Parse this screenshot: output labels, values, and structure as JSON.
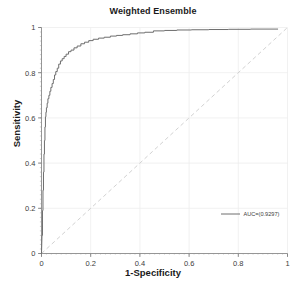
{
  "chart_data": {
    "type": "line",
    "title": "Weighted Ensemble",
    "xlabel": "1-Specificity",
    "ylabel": "Sensitivity",
    "xlim": [
      0,
      1
    ],
    "ylim": [
      0,
      1
    ],
    "grid": true,
    "legend_position": "lower-right",
    "legend": [
      {
        "name": "AUC=(0.9297)",
        "color": "#6e6e6e"
      }
    ],
    "annotations": [
      {
        "name": "chance-diagonal",
        "style": "dashed",
        "color": "#d2d2d2",
        "from": [
          0,
          0
        ],
        "to": [
          1,
          1
        ]
      }
    ],
    "xticks": [
      "0",
      "0.2",
      "0.4",
      "0.6",
      "0.8",
      "1"
    ],
    "xtick_values": [
      0,
      0.2,
      0.4,
      0.6,
      0.8,
      1
    ],
    "yticks": [
      "0",
      "0.2",
      "0.4",
      "0.6",
      "0.8",
      "1"
    ],
    "ytick_values": [
      0,
      0.2,
      0.4,
      0.6,
      0.8,
      1
    ],
    "auc": 0.9297,
    "series": [
      {
        "name": "AUC=(0.9297)",
        "color": "#6e6e6e",
        "x": [
          0,
          0.002,
          0.004,
          0.004,
          0.006,
          0.006,
          0.008,
          0.008,
          0.01,
          0.01,
          0.012,
          0.012,
          0.014,
          0.014,
          0.016,
          0.016,
          0.018,
          0.018,
          0.02,
          0.02,
          0.023,
          0.023,
          0.026,
          0.026,
          0.03,
          0.03,
          0.034,
          0.034,
          0.038,
          0.038,
          0.043,
          0.043,
          0.048,
          0.048,
          0.053,
          0.053,
          0.058,
          0.058,
          0.064,
          0.064,
          0.07,
          0.07,
          0.077,
          0.077,
          0.084,
          0.084,
          0.092,
          0.092,
          0.1,
          0.1,
          0.11,
          0.11,
          0.12,
          0.12,
          0.132,
          0.132,
          0.145,
          0.145,
          0.16,
          0.16,
          0.175,
          0.175,
          0.192,
          0.192,
          0.21,
          0.21,
          0.232,
          0.232,
          0.255,
          0.255,
          0.28,
          0.28,
          0.305,
          0.305,
          0.33,
          0.33,
          0.36,
          0.36,
          0.39,
          0.39,
          0.42,
          0.42,
          0.455,
          0.455,
          0.5,
          0.5,
          0.55,
          0.55,
          0.61,
          0.61,
          0.68,
          0.68,
          0.76,
          0.76,
          0.85,
          0.85,
          0.96
        ],
        "y": [
          0,
          0.08,
          0.08,
          0.19,
          0.19,
          0.28,
          0.28,
          0.36,
          0.36,
          0.44,
          0.44,
          0.5,
          0.5,
          0.56,
          0.56,
          0.605,
          0.605,
          0.625,
          0.625,
          0.645,
          0.645,
          0.665,
          0.665,
          0.685,
          0.685,
          0.7,
          0.7,
          0.718,
          0.718,
          0.735,
          0.735,
          0.752,
          0.752,
          0.77,
          0.77,
          0.79,
          0.79,
          0.805,
          0.805,
          0.82,
          0.82,
          0.838,
          0.838,
          0.852,
          0.852,
          0.862,
          0.862,
          0.872,
          0.872,
          0.882,
          0.882,
          0.893,
          0.893,
          0.9,
          0.9,
          0.91,
          0.91,
          0.918,
          0.918,
          0.928,
          0.928,
          0.935,
          0.935,
          0.942,
          0.942,
          0.948,
          0.948,
          0.953,
          0.953,
          0.957,
          0.957,
          0.962,
          0.962,
          0.965,
          0.965,
          0.968,
          0.968,
          0.972,
          0.972,
          0.976,
          0.976,
          0.979,
          0.979,
          0.985,
          0.985,
          0.987,
          0.987,
          0.989,
          0.989,
          0.99,
          0.99,
          0.991,
          0.991,
          0.992,
          0.992,
          0.993,
          0.993
        ]
      }
    ]
  }
}
